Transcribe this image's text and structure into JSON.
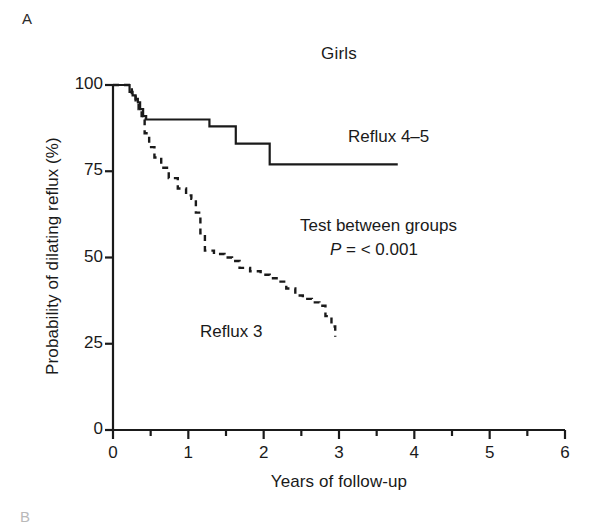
{
  "panel": {
    "label_a": "A",
    "label_b": "B"
  },
  "chart_data": {
    "type": "line",
    "title": "Girls",
    "xlabel": "Years of follow-up",
    "ylabel": "Probability of dilating reflux (%)",
    "xlim": [
      0,
      6
    ],
    "ylim": [
      0,
      100
    ],
    "xticks": [
      0,
      1,
      2,
      3,
      4,
      5,
      6
    ],
    "xtick_labels": [
      "0",
      "1",
      "2",
      "3",
      "4",
      "5",
      "6"
    ],
    "x_minor_tick_interval": 0.5,
    "yticks": [
      0,
      25,
      50,
      75,
      100
    ],
    "ytick_labels": [
      "0",
      "25",
      "50",
      "75",
      "100"
    ],
    "grid": false,
    "legend_position": "inline-annotation",
    "series": [
      {
        "name": "Reflux 4-5",
        "label": "Reflux 4–5",
        "style": "solid",
        "color": "#1a1a1a",
        "step": "post",
        "points": [
          [
            0.0,
            100
          ],
          [
            0.18,
            100
          ],
          [
            0.22,
            98
          ],
          [
            0.26,
            97
          ],
          [
            0.3,
            96
          ],
          [
            0.33,
            95
          ],
          [
            0.36,
            93
          ],
          [
            0.4,
            91
          ],
          [
            0.44,
            90
          ],
          [
            1.28,
            90
          ],
          [
            1.28,
            88
          ],
          [
            1.63,
            88
          ],
          [
            1.63,
            83
          ],
          [
            2.08,
            83
          ],
          [
            2.08,
            77
          ],
          [
            3.78,
            77
          ]
        ]
      },
      {
        "name": "Reflux 3",
        "label": "Reflux 3",
        "style": "dashed",
        "color": "#1a1a1a",
        "step": "post",
        "points": [
          [
            0.0,
            100
          ],
          [
            0.2,
            100
          ],
          [
            0.25,
            97
          ],
          [
            0.3,
            95
          ],
          [
            0.34,
            93
          ],
          [
            0.38,
            90
          ],
          [
            0.42,
            86
          ],
          [
            0.48,
            82
          ],
          [
            0.55,
            79
          ],
          [
            0.64,
            76
          ],
          [
            0.74,
            73
          ],
          [
            0.86,
            70
          ],
          [
            0.97,
            68
          ],
          [
            1.04,
            67
          ],
          [
            1.1,
            63
          ],
          [
            1.16,
            57
          ],
          [
            1.22,
            52
          ],
          [
            1.34,
            51
          ],
          [
            1.48,
            50
          ],
          [
            1.58,
            49
          ],
          [
            1.68,
            47
          ],
          [
            1.82,
            46
          ],
          [
            1.96,
            45
          ],
          [
            2.08,
            44
          ],
          [
            2.2,
            43
          ],
          [
            2.3,
            41
          ],
          [
            2.42,
            39
          ],
          [
            2.52,
            38
          ],
          [
            2.64,
            37
          ],
          [
            2.74,
            36
          ],
          [
            2.82,
            33
          ],
          [
            2.9,
            30
          ],
          [
            2.95,
            27
          ]
        ]
      }
    ],
    "annotations": [
      {
        "name": "test-between-groups",
        "text": "Test between groups"
      },
      {
        "name": "p-value",
        "italic_prefix": "P",
        "text": " = < 0.001",
        "full": "P = < 0.001"
      }
    ]
  }
}
